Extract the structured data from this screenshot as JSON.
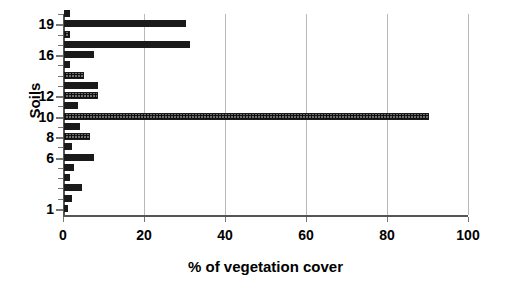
{
  "chart_data": {
    "type": "bar",
    "orientation": "horizontal",
    "title": "",
    "xlabel": "% of vegetation cover",
    "ylabel": "Soils",
    "xlim": [
      0,
      100
    ],
    "ylim": [
      0.4,
      20.0
    ],
    "xticks": [
      0,
      20,
      40,
      60,
      80,
      100
    ],
    "yticks": [
      1,
      6,
      8,
      10,
      12,
      16,
      19
    ],
    "ytick_labels": [
      "1",
      "6",
      "8",
      "10",
      "12",
      "16",
      "19"
    ],
    "xtick_labels": [
      "0",
      "20",
      "40",
      "60",
      "80",
      "100"
    ],
    "grid": "vertical",
    "legend": "none",
    "categories": [
      1,
      2,
      3,
      4,
      5,
      6,
      7,
      8,
      9,
      10,
      11,
      12,
      13,
      14,
      15,
      16,
      17,
      18,
      19,
      20
    ],
    "values": [
      1.0,
      2.0,
      4.5,
      1.5,
      2.5,
      7.5,
      2.0,
      6.5,
      4.0,
      90.0,
      3.5,
      8.5,
      8.5,
      5.0,
      1.5,
      7.5,
      31.0,
      1.5,
      30.0,
      1.5
    ],
    "bar_styles": [
      "solid",
      "solid",
      "solid",
      "solid",
      "solid",
      "solid",
      "solid",
      "hatch",
      "solid",
      "hatch",
      "solid",
      "hatch",
      "solid",
      "hatch",
      "solid",
      "solid",
      "solid",
      "hatch",
      "solid",
      "solid"
    ],
    "colors": {
      "bar_solid": "#1a1a1a",
      "bar_hatch": "#6e6e6e",
      "gridline": "#b8b8b8",
      "axis": "#555555",
      "text": "#000000",
      "background": "#ffffff"
    }
  },
  "axes": {
    "x_title": "% of vegetation cover",
    "y_title": "Soils"
  }
}
